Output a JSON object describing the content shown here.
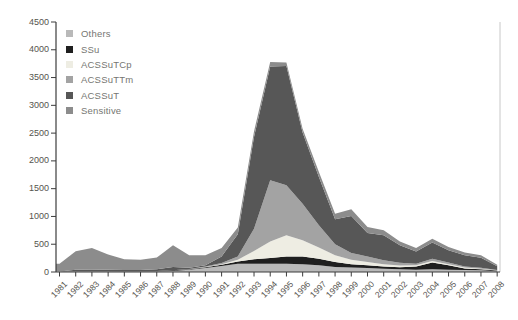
{
  "chart_data": {
    "type": "area",
    "stacked": true,
    "title": "",
    "xlabel": "",
    "ylabel": "",
    "ylim": [
      0,
      4500
    ],
    "y_ticks": [
      "0",
      "500",
      "1000",
      "1500",
      "2000",
      "2500",
      "3000",
      "3500",
      "4000",
      "4500"
    ],
    "categories": [
      "1981",
      "1982",
      "1983",
      "1984",
      "1985",
      "1986",
      "1987",
      "1988",
      "1989",
      "1990",
      "1991",
      "1992",
      "1993",
      "1994",
      "1995",
      "1996",
      "1997",
      "1998",
      "1999",
      "2000",
      "2001",
      "2002",
      "2003",
      "2004",
      "2005",
      "2006",
      "2007",
      "2008"
    ],
    "grid": false,
    "legend_position": "top-left-inside",
    "legend_order_top_to_bottom": [
      "Others",
      "SSu",
      "ACSSuTCp",
      "ACSSuTTm",
      "ACSSuT",
      "Sensitive"
    ],
    "stack_order_bottom_to_top": [
      "Others",
      "SSu",
      "ACSSuTCp",
      "ACSSuTTm",
      "ACSSuT",
      "Sensitive"
    ],
    "series": [
      {
        "name": "Others",
        "color": "#b9b9b9",
        "values": [
          8,
          12,
          15,
          12,
          10,
          10,
          12,
          20,
          40,
          70,
          110,
          150,
          150,
          150,
          150,
          140,
          120,
          90,
          80,
          70,
          60,
          50,
          40,
          50,
          40,
          35,
          30,
          15
        ]
      },
      {
        "name": "SSu",
        "color": "#1f1f1f",
        "values": [
          2,
          5,
          5,
          5,
          5,
          5,
          8,
          10,
          10,
          15,
          20,
          40,
          80,
          100,
          130,
          140,
          120,
          90,
          60,
          50,
          40,
          35,
          60,
          120,
          80,
          30,
          20,
          10
        ]
      },
      {
        "name": "ACSSuTCp",
        "color": "#eeede3",
        "values": [
          0,
          0,
          0,
          0,
          0,
          0,
          0,
          0,
          0,
          5,
          10,
          30,
          150,
          300,
          380,
          290,
          200,
          120,
          80,
          60,
          40,
          30,
          20,
          30,
          20,
          15,
          10,
          5
        ]
      },
      {
        "name": "ACSSuTTm",
        "color": "#a3a3a3",
        "values": [
          0,
          0,
          0,
          0,
          0,
          0,
          0,
          0,
          5,
          10,
          20,
          60,
          400,
          1100,
          900,
          660,
          400,
          200,
          120,
          100,
          70,
          50,
          30,
          40,
          30,
          20,
          15,
          5
        ]
      },
      {
        "name": "ACSSuT",
        "color": "#575757",
        "values": [
          0,
          25,
          25,
          25,
          20,
          20,
          30,
          60,
          20,
          20,
          120,
          400,
          1650,
          2050,
          2150,
          1280,
          870,
          450,
          670,
          420,
          450,
          315,
          220,
          290,
          220,
          200,
          180,
          70
        ]
      },
      {
        "name": "Sensitive",
        "color": "#8c8c8c",
        "values": [
          140,
          330,
          385,
          275,
          195,
          185,
          210,
          390,
          225,
          180,
          150,
          120,
          100,
          80,
          60,
          70,
          90,
          100,
          120,
          110,
          90,
          70,
          60,
          70,
          60,
          50,
          45,
          25
        ]
      }
    ],
    "axis_colors": {
      "axis_line": "#3c3c3c",
      "right_spine": "#c8c8c8",
      "tick_label": "#55544e"
    }
  }
}
